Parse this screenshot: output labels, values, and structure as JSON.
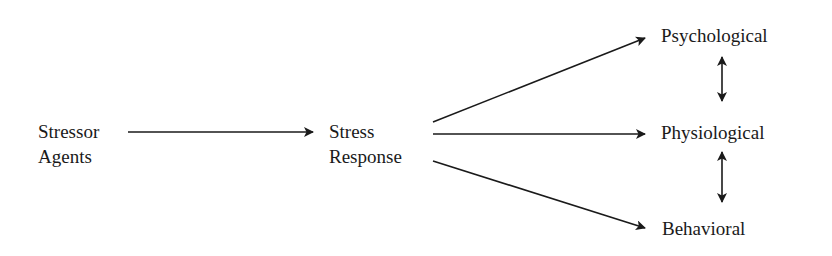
{
  "diagram": {
    "type": "flow",
    "nodes": {
      "stressor": {
        "line1": "Stressor",
        "line2": "Agents"
      },
      "response": {
        "line1": "Stress",
        "line2": "Response"
      },
      "psychological": {
        "label": "Psychological"
      },
      "physiological": {
        "label": "Physiological"
      },
      "behavioral": {
        "label": "Behavioral"
      }
    },
    "edges": [
      {
        "from": "Stressor Agents",
        "to": "Stress Response",
        "kind": "directed"
      },
      {
        "from": "Stress Response",
        "to": "Psychological",
        "kind": "directed"
      },
      {
        "from": "Stress Response",
        "to": "Physiological",
        "kind": "directed"
      },
      {
        "from": "Stress Response",
        "to": "Behavioral",
        "kind": "directed"
      },
      {
        "from": "Psychological",
        "to": "Physiological",
        "kind": "bidirectional"
      },
      {
        "from": "Physiological",
        "to": "Behavioral",
        "kind": "bidirectional"
      }
    ],
    "colors": {
      "ink": "#1a1a1a",
      "background": "#ffffff"
    }
  }
}
